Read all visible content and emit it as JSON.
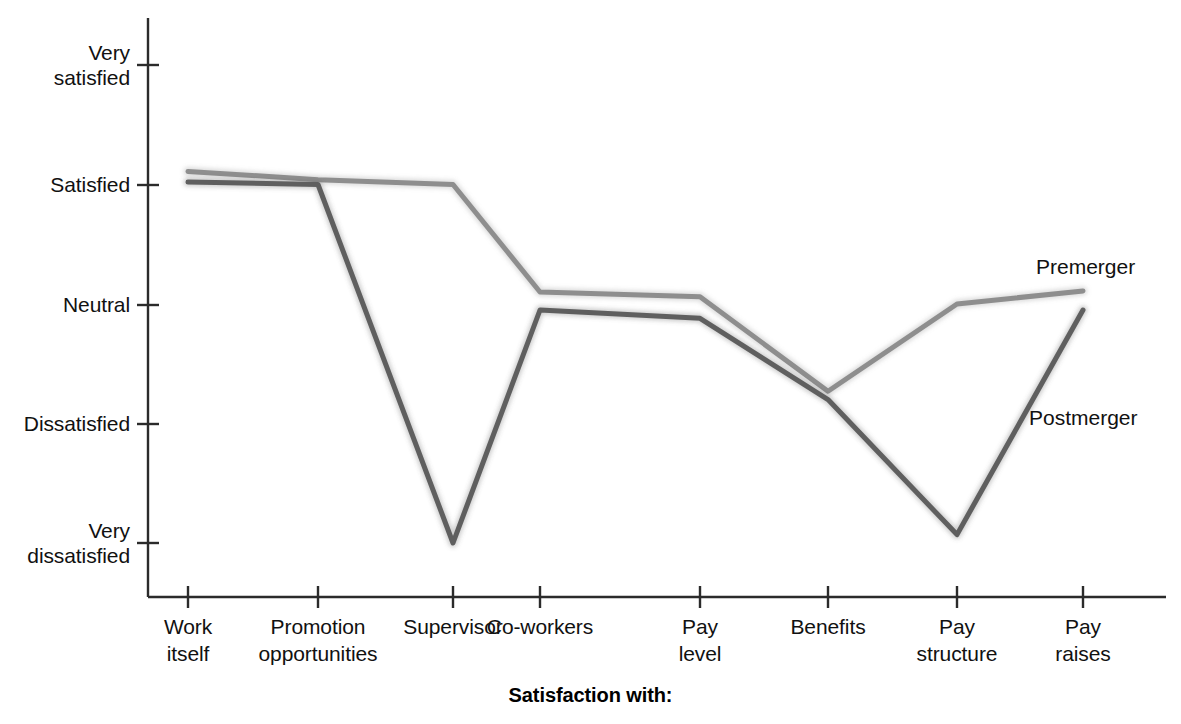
{
  "chart_data": {
    "type": "line",
    "title": "",
    "xlabel": "Satisfaction with:",
    "ylabel": "",
    "grid": false,
    "legend_position": "inline-right",
    "categories": [
      "Work\nitself",
      "Promotion\nopportunities",
      "Supervisor",
      "Co-workers",
      "Pay\nlevel",
      "Benefits",
      "Pay\nstructure",
      "Pay\nraises"
    ],
    "ytick_labels": [
      "Very\nsatisfied",
      "Satisfied",
      "Neutral",
      "Dissatisfied",
      "Very\ndissatisfied"
    ],
    "ytick_values": [
      5,
      4,
      3,
      2,
      1
    ],
    "ylim": [
      0.55,
      5.35
    ],
    "series": [
      {
        "name": "Premerger",
        "color": "#8e8e8e",
        "values": [
          4.11,
          4.04,
          4.0,
          3.1,
          3.06,
          2.27,
          3.0,
          3.11
        ]
      },
      {
        "name": "Postmerger",
        "color": "#5f5f5f",
        "values": [
          4.02,
          4.0,
          1.0,
          2.95,
          2.88,
          2.2,
          1.07,
          2.95
        ]
      }
    ]
  },
  "labels": {
    "premerger": "Premerger",
    "postmerger": "Postmerger",
    "axis_title": "Satisfaction with:"
  }
}
